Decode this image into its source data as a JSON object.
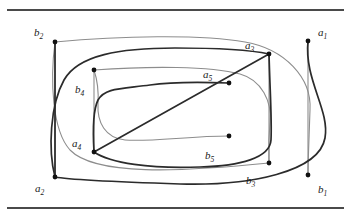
{
  "figure": {
    "type": "arc-diagram",
    "canvas": {
      "width": 351,
      "height": 219
    },
    "colors": {
      "background": "#ffffff",
      "dark_strand": "#2b2b2b",
      "light_strand": "#8d8d8d",
      "boundary_line": "#4a4a4a",
      "vertex_dot": "#111111",
      "label_text": "#1a1a1a"
    },
    "strand_widths": {
      "dark": 1.7,
      "light": 1.1,
      "boundary": 2.0
    },
    "boundaries": [
      {
        "name": "top-boundary-line",
        "x1": 8,
        "y1": 10,
        "x2": 343,
        "y2": 10
      },
      {
        "name": "bottom-boundary-line",
        "x1": 8,
        "y1": 208,
        "x2": 343,
        "y2": 208
      }
    ],
    "vertices": [
      {
        "id": "a1",
        "label": "a",
        "sub": "1",
        "x": 308,
        "y": 41,
        "label_x": 318,
        "label_y": 27,
        "strand": "dark"
      },
      {
        "id": "a2",
        "label": "a",
        "sub": "2",
        "x": 55,
        "y": 177,
        "label_x": 35,
        "label_y": 183,
        "strand": "dark"
      },
      {
        "id": "a3",
        "label": "a",
        "sub": "3",
        "x": 269,
        "y": 54,
        "label_x": 245,
        "label_y": 40,
        "strand": "dark"
      },
      {
        "id": "a4",
        "label": "a",
        "sub": "4",
        "x": 94,
        "y": 152,
        "label_x": 72,
        "label_y": 138,
        "strand": "dark"
      },
      {
        "id": "a5",
        "label": "a",
        "sub": "5",
        "x": 229,
        "y": 83,
        "label_x": 203,
        "label_y": 69,
        "strand": "dark"
      },
      {
        "id": "b1",
        "label": "b",
        "sub": "1",
        "x": 308,
        "y": 175,
        "label_x": 318,
        "label_y": 184,
        "strand": "light"
      },
      {
        "id": "b2",
        "label": "b",
        "sub": "2",
        "x": 55,
        "y": 42,
        "label_x": 34,
        "label_y": 27,
        "strand": "light"
      },
      {
        "id": "b3",
        "label": "b",
        "sub": "3",
        "x": 269,
        "y": 163,
        "label_x": 246,
        "label_y": 175,
        "strand": "light"
      },
      {
        "id": "b4",
        "label": "b",
        "sub": "4",
        "x": 94,
        "y": 70,
        "label_x": 75,
        "label_y": 84,
        "strand": "light"
      },
      {
        "id": "b5",
        "label": "b",
        "sub": "5",
        "x": 229,
        "y": 136,
        "label_x": 205,
        "label_y": 150,
        "strand": "light"
      }
    ],
    "arcs": [
      {
        "name": "arc-a1-a2",
        "strand": "dark",
        "from": "a1",
        "to": "a2",
        "d": "M 308 41 C 304 80 330 110 325 138 C 319 172 250 186 180 184 C 120 182 70 180 55 177"
      },
      {
        "name": "arc-a3-a4",
        "strand": "dark",
        "from": "a3",
        "to": "a4",
        "d": "M 269 54 C 270 92 272 120 271 140 C 270 158 240 166 200 167 C 150 169 110 163 94 152"
      },
      {
        "name": "arc-a2-a3-outer",
        "strand": "dark",
        "from": "a2",
        "to": "a3",
        "d": "M 55 177 L 55 42 M 55 42 C 56 42 56 42 56 42"
      },
      {
        "name": "arc-a5-loop",
        "strand": "dark",
        "from": "a5",
        "to": "a4",
        "d": "M 229 83 C 200 82 170 82 150 85 C 120 89 105 88 98 100 C 92 112 93 135 94 152"
      },
      {
        "name": "arc-dark-outer-top",
        "strand": "dark",
        "from": "a2",
        "to": "a3",
        "d": "M 55 177 C 48 150 50 105 64 80 C 78 55 120 48 175 48 C 222 48 255 51 269 54"
      },
      {
        "name": "arc-dark-inner-top",
        "strand": "dark",
        "from": "a4",
        "to": "a3",
        "d": "M 94 152 L 269 54"
      },
      {
        "name": "arc-b2-b1",
        "strand": "light",
        "from": "b2",
        "to": "b1",
        "d": "M 55 42 C 120 36 200 34 245 42 C 285 49 312 78 310 110 C 309 140 308 162 308 175"
      },
      {
        "name": "arc-b4-b3",
        "strand": "light",
        "from": "b4",
        "to": "b3",
        "d": "M 94 70 C 150 66 210 66 240 74 C 262 80 272 102 270 122 C 268 144 269 157 269 163"
      },
      {
        "name": "arc-b2-b3-sweep",
        "strand": "light",
        "from": "b2",
        "to": "b3",
        "d": "M 55 42 C 50 80 52 130 70 150 C 95 176 180 172 269 163"
      },
      {
        "name": "arc-b5-loop",
        "strand": "light",
        "from": "b5",
        "to": "b4",
        "d": "M 229 136 C 190 136 150 142 125 140 C 105 138 97 122 98 104 C 99 88 96 76 94 70"
      },
      {
        "name": "arc-b-left-vertical",
        "strand": "light",
        "from": "b2",
        "to": "a2",
        "d": "M 55 42 L 55 177"
      },
      {
        "name": "arc-b4-a4-vertical",
        "strand": "light",
        "from": "b4",
        "to": "a4",
        "d": "M 94 70 L 94 152"
      },
      {
        "name": "arc-a3-b3-vertical",
        "strand": "light",
        "from": "a3",
        "to": "b3",
        "d": "M 269 54 L 269 163"
      },
      {
        "name": "arc-a1-b1-vertical",
        "strand": "light",
        "from": "a1",
        "to": "b1",
        "d": "M 308 41 L 308 175"
      }
    ]
  }
}
